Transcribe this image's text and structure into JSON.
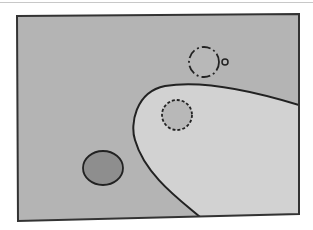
{
  "diagram": {
    "colors": {
      "background": "#ffffff",
      "outer_region": "#b4b4b4",
      "inner_region": "#d2d2d2",
      "stroke": "#222222",
      "circle_light_fill": "#b8b8b8",
      "circle_dark_fill": "#8e8e8e"
    },
    "frame": {
      "points": [
        [
          17,
          16
        ],
        [
          299,
          14
        ],
        [
          299,
          214
        ],
        [
          18,
          221
        ]
      ]
    },
    "boundary_curve": {
      "style": "solid",
      "path": "M 299 105 C 250 90, 200 80, 165 86 C 135 92, 130 125, 135 140 C 145 175, 180 200, 200 217"
    },
    "shapes": [
      {
        "id": "dash-dot-circle",
        "cx": 204,
        "cy": 62,
        "r": 15,
        "stroke_style": "dash-dot",
        "fill": "light"
      },
      {
        "id": "small-circle",
        "cx": 225,
        "cy": 62,
        "r": 3,
        "stroke_style": "solid",
        "fill": "light"
      },
      {
        "id": "dashed-circle",
        "cx": 177,
        "cy": 115,
        "r": 15,
        "stroke_style": "dashed",
        "fill": "light"
      },
      {
        "id": "solid-ellipse",
        "cx": 103,
        "cy": 168,
        "rx": 20,
        "ry": 17,
        "stroke_style": "solid",
        "fill": "dark"
      }
    ]
  }
}
